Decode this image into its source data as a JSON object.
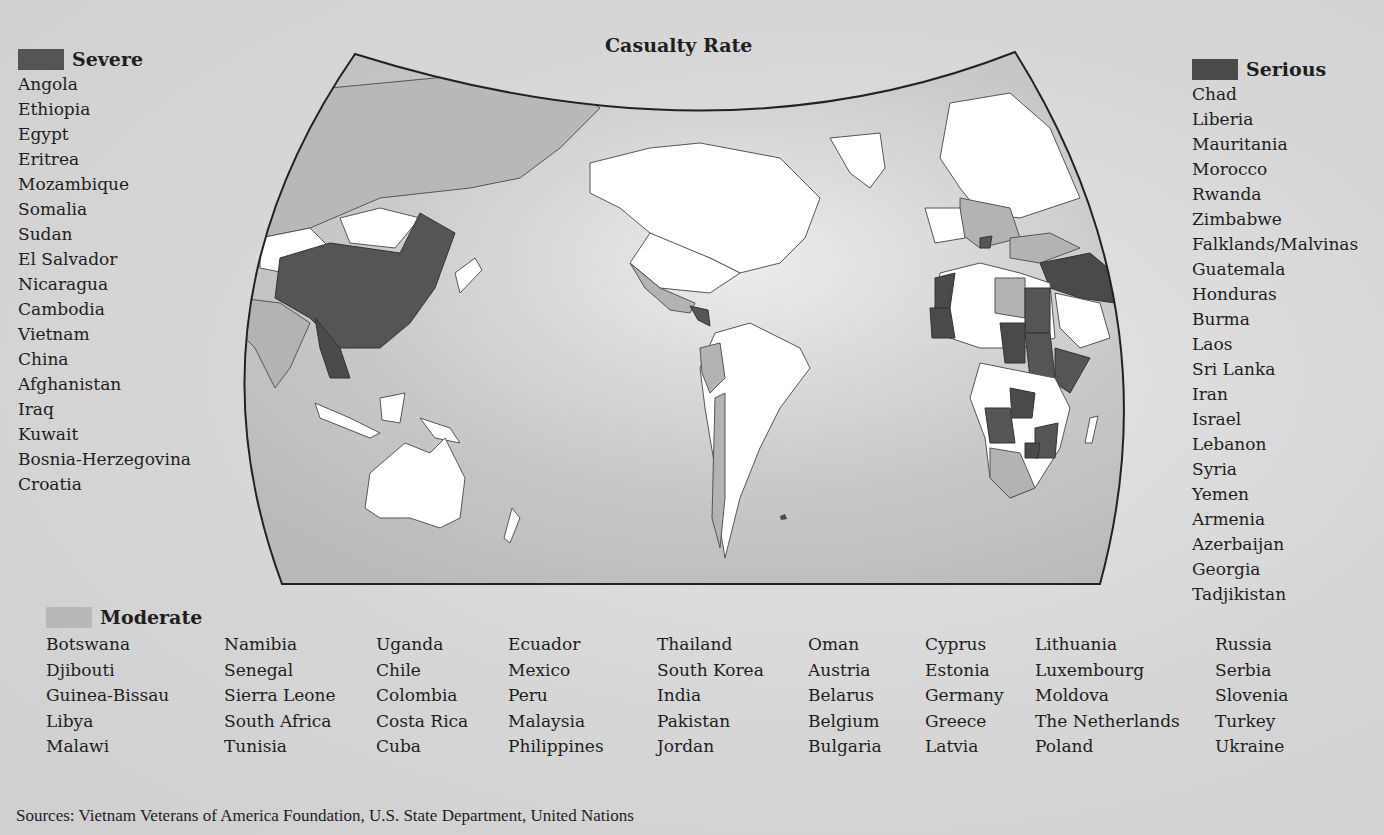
{
  "map": {
    "title": "Casualty Rate",
    "colors": {
      "severe": "#555555",
      "serious": "#4a4a4a",
      "moderate": "#b3b3b3",
      "none": "#ffffff",
      "ocean": "#c9c9c9",
      "border": "#333333"
    }
  },
  "legend": {
    "severe": {
      "label": "Severe",
      "countries": [
        "Angola",
        "Ethiopia",
        "Egypt",
        "Eritrea",
        "Mozambique",
        "Somalia",
        "Sudan",
        "El Salvador",
        "Nicaragua",
        "Cambodia",
        "Vietnam",
        "China",
        "Afghanistan",
        "Iraq",
        "Kuwait",
        "Bosnia-Herzegovina",
        "Croatia"
      ]
    },
    "serious": {
      "label": "Serious",
      "countries": [
        "Chad",
        "Liberia",
        "Mauritania",
        "Morocco",
        "Rwanda",
        "Zimbabwe",
        "Falklands/Malvinas",
        "Guatemala",
        "Honduras",
        "Burma",
        "Laos",
        "Sri Lanka",
        "Iran",
        "Israel",
        "Lebanon",
        "Syria",
        "Yemen",
        "Armenia",
        "Azerbaijan",
        "Georgia",
        "Tadjikistan"
      ]
    },
    "moderate": {
      "label": "Moderate",
      "columns": [
        [
          "Botswana",
          "Djibouti",
          "Guinea-Bissau",
          "Libya",
          "Malawi"
        ],
        [
          "Namibia",
          "Senegal",
          "Sierra Leone",
          "South Africa",
          "Tunisia"
        ],
        [
          "Uganda",
          "Chile",
          "Colombia",
          "Costa Rica",
          "Cuba"
        ],
        [
          "Ecuador",
          "Mexico",
          "Peru",
          "Malaysia",
          "Philippines"
        ],
        [
          "Thailand",
          "South Korea",
          "India",
          "Pakistan",
          "Jordan"
        ],
        [
          "Oman",
          "Austria",
          "Belarus",
          "Belgium",
          "Bulgaria"
        ],
        [
          "Cyprus",
          "Estonia",
          "Germany",
          "Greece",
          "Latvia"
        ],
        [
          "Lithuania",
          "Luxembourg",
          "Moldova",
          "The Netherlands",
          "Poland"
        ],
        [
          "Russia",
          "Serbia",
          "Slovenia",
          "Turkey",
          "Ukraine"
        ]
      ]
    }
  },
  "footer": {
    "sources": "Sources: Vietnam Veterans of America Foundation, U.S. State Department, United Nations"
  }
}
